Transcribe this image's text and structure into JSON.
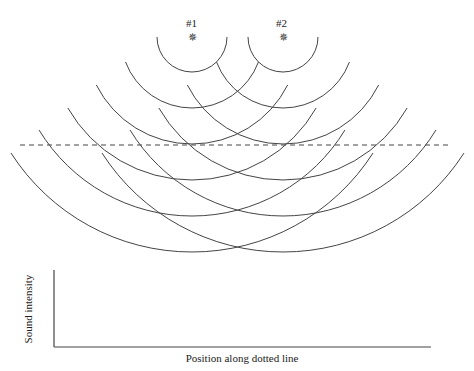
{
  "sources": [
    {
      "label": "#1",
      "x": 192,
      "y": 37
    },
    {
      "label": "#2",
      "x": 283,
      "y": 37
    }
  ],
  "radii": [
    35,
    71,
    107,
    143,
    179,
    215
  ],
  "arc_left_ends": [
    [
      157,
      37
    ],
    [
      127,
      62
    ],
    [
      99,
      85
    ],
    [
      71,
      108
    ],
    [
      43,
      130
    ],
    [
      16,
      153
    ]
  ],
  "dotted_line": {
    "x1": 20,
    "x2": 452,
    "y": 145
  },
  "graph": {
    "ylabel": "Sound intensity",
    "xlabel": "Position along dotted line"
  },
  "colors": {
    "line": "#444444"
  }
}
